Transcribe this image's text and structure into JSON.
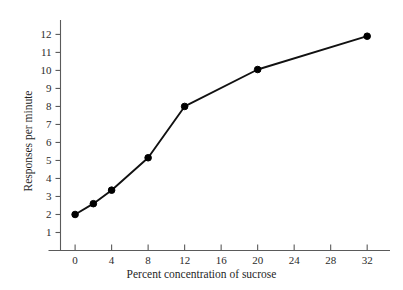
{
  "figure": {
    "caption_remnant": "",
    "background_color": "#ffffff",
    "axis_color": "#5a5a5a",
    "line_color": "#111111",
    "marker_color": "#000000"
  },
  "chart_data": {
    "type": "line",
    "title": "",
    "xlabel": "Percent concentration of sucrose",
    "ylabel": "Responses per minute",
    "x": [
      0,
      2,
      4,
      8,
      12,
      20,
      32
    ],
    "values": [
      2.0,
      2.6,
      3.35,
      5.15,
      8.0,
      10.05,
      11.9
    ],
    "series": [
      {
        "name": "Responses per minute",
        "x": [
          0,
          2,
          4,
          8,
          12,
          20,
          32
        ],
        "values": [
          2.0,
          2.6,
          3.35,
          5.15,
          8.0,
          10.05,
          11.9
        ]
      }
    ],
    "xticks": [
      0,
      4,
      8,
      12,
      16,
      20,
      24,
      28,
      32
    ],
    "xtick_labels": [
      "0",
      "4",
      "8",
      "12",
      "16",
      "20",
      "24",
      "28",
      "32"
    ],
    "yticks": [
      1,
      2,
      3,
      4,
      5,
      6,
      7,
      8,
      9,
      10,
      11,
      12
    ],
    "ytick_labels": [
      "1",
      "2",
      "3",
      "4",
      "5",
      "6",
      "7",
      "8",
      "9",
      "10",
      "11",
      "12"
    ],
    "xlim": [
      -1.6,
      34.5
    ],
    "ylim": [
      0,
      12.8
    ],
    "grid": false,
    "legend": false,
    "marker": "circle",
    "tick_direction": {
      "x": "in",
      "y": "out"
    }
  }
}
